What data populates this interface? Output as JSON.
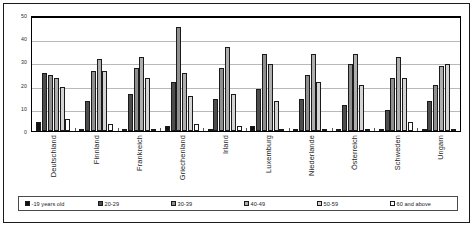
{
  "chart_data": {
    "type": "bar",
    "title": "",
    "xlabel": "",
    "ylabel": "",
    "ylim": [
      0,
      50
    ],
    "yticks": [
      0,
      10,
      20,
      30,
      40,
      50
    ],
    "grid": true,
    "legend_position": "bottom",
    "categories": [
      "Deutschland",
      "Finnland",
      "Frankreich",
      "Griechenland",
      "Irland",
      "Luxemburg",
      "Niederlande",
      "Österreich",
      "Schweden",
      "Ungarn"
    ],
    "series": [
      {
        "name": "-19 years old",
        "color": "#111111",
        "values": [
          4,
          0,
          0,
          2,
          0,
          2,
          0,
          0,
          0,
          0
        ]
      },
      {
        "name": "20-29",
        "color": "#4d4d4d",
        "values": [
          25,
          13,
          16,
          21,
          14,
          18,
          14,
          11,
          9,
          13
        ]
      },
      {
        "name": "30-39",
        "color": "#8f8f8f",
        "values": [
          24,
          26,
          27,
          45,
          27,
          33,
          24,
          29,
          23,
          20
        ]
      },
      {
        "name": "40-49",
        "color": "#aeaeae",
        "values": [
          23,
          31,
          32,
          25,
          36,
          29,
          33,
          33,
          32,
          28
        ]
      },
      {
        "name": "50-59",
        "color": "#d4d4d4",
        "values": [
          19,
          26,
          23,
          15,
          16,
          13,
          21,
          20,
          23,
          29
        ]
      },
      {
        "name": "60 and above",
        "color": "#ffffff",
        "values": [
          5,
          3,
          1,
          3,
          2,
          1,
          1,
          1,
          4,
          1
        ]
      }
    ]
  }
}
